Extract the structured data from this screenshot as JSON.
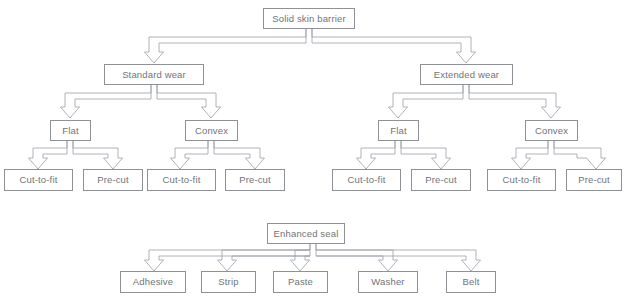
{
  "diagram": {
    "type": "tree-flowchart",
    "colors": {
      "box_border": "#8e9196",
      "text": "#6f7479",
      "connector": "#9aa0a5",
      "background": "#ffffff"
    },
    "trees": [
      {
        "id": "solid-skin-barrier-tree",
        "root": "Solid skin barrier",
        "levels": [
          [
            "Standard wear",
            "Extended wear"
          ],
          [
            "Flat",
            "Convex",
            "Flat",
            "Convex"
          ],
          [
            "Cut-to-fit",
            "Pre-cut",
            "Cut-to-fit",
            "Pre-cut",
            "Cut-to-fit",
            "Pre-cut",
            "Cut-to-fit",
            "Pre-cut"
          ]
        ]
      },
      {
        "id": "enhanced-seal-tree",
        "root": "Enhanced seal",
        "levels": [
          [
            "Adhesive",
            "Strip",
            "Paste",
            "Washer",
            "Belt"
          ]
        ]
      }
    ],
    "nodes": {
      "root": {
        "label": "Solid skin barrier"
      },
      "standard_wear": {
        "label": "Standard wear"
      },
      "extended_wear": {
        "label": "Extended wear"
      },
      "sw_flat": {
        "label": "Flat"
      },
      "sw_convex": {
        "label": "Convex"
      },
      "ew_flat": {
        "label": "Flat"
      },
      "ew_convex": {
        "label": "Convex"
      },
      "sw_flat_ctf": {
        "label": "Cut-to-fit"
      },
      "sw_flat_pc": {
        "label": "Pre-cut"
      },
      "sw_convex_ctf": {
        "label": "Cut-to-fit"
      },
      "sw_convex_pc": {
        "label": "Pre-cut"
      },
      "ew_flat_ctf": {
        "label": "Cut-to-fit"
      },
      "ew_flat_pc": {
        "label": "Pre-cut"
      },
      "ew_convex_ctf": {
        "label": "Cut-to-fit"
      },
      "ew_convex_pc": {
        "label": "Pre-cut"
      },
      "enhanced_seal": {
        "label": "Enhanced seal"
      },
      "adhesive": {
        "label": "Adhesive"
      },
      "strip": {
        "label": "Strip"
      },
      "paste": {
        "label": "Paste"
      },
      "washer": {
        "label": "Washer"
      },
      "belt": {
        "label": "Belt"
      }
    }
  }
}
